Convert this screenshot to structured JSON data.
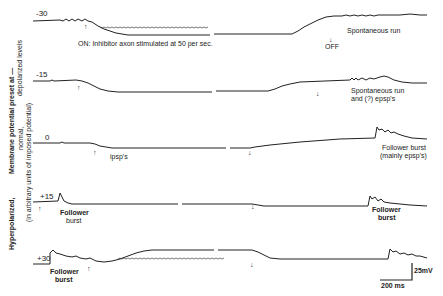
{
  "figure": {
    "y_axis_label": {
      "line1_bold": "Hyperpolarized,",
      "line1_bold_b": "Membrane potential preset at —",
      "line2": "normal,",
      "line3": "(in arbitrary units of imposed potential)",
      "line4": "depolarized levels"
    },
    "traces": [
      {
        "level": "-30",
        "annotations": [
          "ON: Inhibitor axon stimulated at 50 per sec.",
          "OFF",
          "Spontaneous run"
        ],
        "on_arrow": "↑",
        "off_arrow": "↓"
      },
      {
        "level": "-15",
        "annotations": [
          "Spontaneous run",
          "and (?) epsp's"
        ],
        "on_arrow": "↑",
        "off_arrow": "↓"
      },
      {
        "level": "0",
        "annotations": [
          "ipsp's",
          "Follower burst",
          "(mainly epsp's)"
        ],
        "on_arrow": "↑",
        "off_arrow": "↓"
      },
      {
        "level": "+15",
        "annotations": [
          "Follower",
          "burst",
          "Follower",
          "burst"
        ],
        "on_arrow": "↑",
        "off_arrow": "↓"
      },
      {
        "level": "+30",
        "annotations": [
          "Follower",
          "burst"
        ],
        "on_arrow": "↑",
        "off_arrow": "↓"
      }
    ],
    "scale_bar": {
      "voltage": "25mV",
      "time": "200 ms"
    }
  }
}
